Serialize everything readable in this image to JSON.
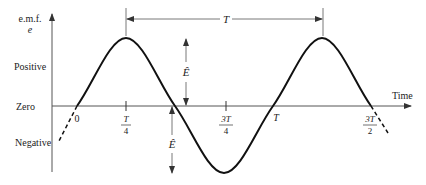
{
  "diagram": {
    "type": "sine-wave-emf",
    "y_axis": {
      "label_line1": "e.m.f.",
      "label_line2": "e",
      "levels": {
        "positive": "Positive",
        "zero": "Zero",
        "negative": "Negative"
      }
    },
    "x_axis": {
      "label": "Time",
      "ticks": [
        {
          "num": "0",
          "den": ""
        },
        {
          "num": "T",
          "den": "4"
        },
        {
          "num": "3T",
          "den": "4"
        },
        {
          "num": "T",
          "den": ""
        },
        {
          "num": "3T",
          "den": "2"
        }
      ]
    },
    "annotations": {
      "period": "T",
      "amplitude_positive": "Ê",
      "amplitude_negative": "Ê"
    },
    "colors": {
      "ink": "#222222",
      "axis": "#555555",
      "background": "#ffffff"
    }
  }
}
